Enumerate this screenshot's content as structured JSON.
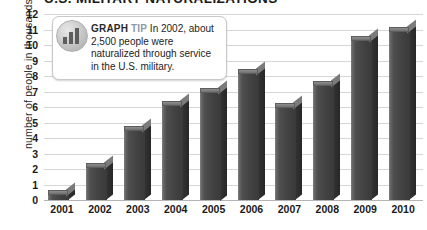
{
  "chart_data": {
    "type": "bar",
    "title": "U.S. MILITARY NATURALIZATIONS",
    "xlabel": "",
    "ylabel": "number of people in thousands",
    "ylim": [
      0,
      12
    ],
    "ytick_step": 1,
    "grid": true,
    "legend": "none",
    "categories": [
      "2001",
      "2002",
      "2003",
      "2004",
      "2005",
      "2006",
      "2007",
      "2008",
      "2009",
      "2010"
    ],
    "values": [
      0.4,
      2.1,
      4.5,
      6.1,
      7.0,
      8.2,
      6.0,
      7.4,
      10.3,
      10.9
    ],
    "ytick_labels": [
      "12",
      "11",
      "10",
      "9",
      "8",
      "7",
      "6",
      "5",
      "4",
      "3",
      "2",
      "1",
      "0"
    ]
  },
  "annotation": {
    "icon": "bar-chart-badge-icon",
    "kicker": "GRAPH",
    "kicker_accent": "TIP",
    "body": "In 2002, about 2,500 people were naturalized through service in the U.S. military."
  },
  "colors": {
    "bar_front": "#434343",
    "bar_side": "#2b2b2b",
    "bar_top": "#7b7b7b",
    "gridline": "#d6d6d6",
    "baseline": "#b4b4b4",
    "background": "#ffffff",
    "text": "#1a1a1a",
    "tip_accent": "#8c9aa8"
  }
}
